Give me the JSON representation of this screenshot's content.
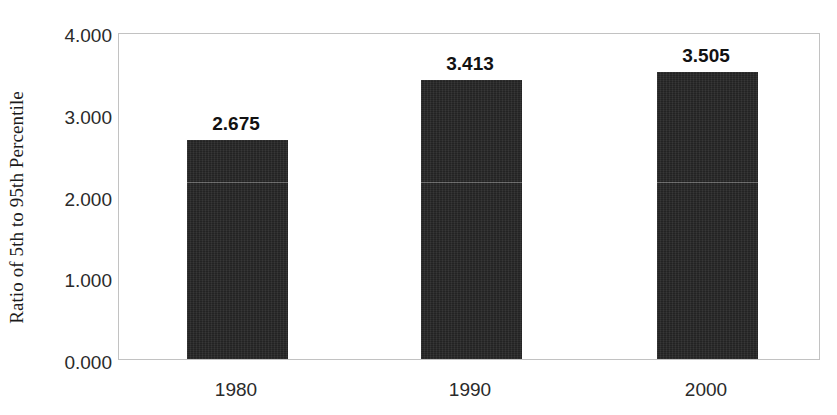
{
  "chart_data": {
    "type": "bar",
    "title": "",
    "subtitle": "",
    "xlabel": "",
    "ylabel": "Ratio of 5th to 95th Percentile",
    "categories": [
      "1980",
      "1990",
      "2000"
    ],
    "values": [
      2.675,
      3.413,
      3.505
    ],
    "data_labels": [
      "2.675",
      "3.413",
      "3.505"
    ],
    "ylim": [
      0,
      4
    ],
    "ytick_values": [
      0,
      1,
      2,
      3,
      4
    ],
    "ytick_labels": [
      "0.000",
      "1.000",
      "2.000",
      "3.000",
      "4.000"
    ],
    "grid": false,
    "legend": null,
    "legend_position": "none",
    "bar_color": "#232323",
    "plot_border_color": "#c2c2c2",
    "background_color": "#ffffff"
  }
}
